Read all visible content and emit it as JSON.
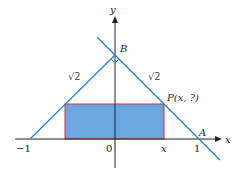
{
  "figure": {
    "axes": {
      "x_label": "x",
      "y_label": "y"
    },
    "ticks": {
      "neg_one": "−1",
      "zero": "0",
      "x": "x",
      "one": "1"
    },
    "points": {
      "B": "B",
      "A": "A",
      "P": "P(x, ?)"
    },
    "annotations": {
      "left_side": "√2",
      "right_side": "√2"
    },
    "colors": {
      "line": "#2a7fd4",
      "rect_fill": "#6aa6e0",
      "rect_stroke": "#d03030",
      "axis": "#222222"
    }
  }
}
